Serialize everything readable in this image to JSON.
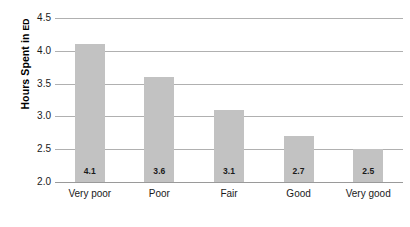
{
  "chart_data": {
    "type": "bar",
    "title": "",
    "subtitle": "",
    "xlabel": "",
    "ylabel": "Hours Spent in ED",
    "ylabel_main": "Hours Spent in",
    "ylabel_smallcaps": "ED",
    "categories": [
      "Very poor",
      "Poor",
      "Fair",
      "Good",
      "Very good"
    ],
    "values": [
      4.1,
      3.6,
      3.1,
      2.7,
      2.5
    ],
    "value_labels": [
      "4.1",
      "3.6",
      "3.1",
      "2.7",
      "2.5"
    ],
    "ylim": [
      2.0,
      4.5
    ],
    "ytick_labels": [
      "4.5",
      "4.0",
      "3.5",
      "3.0",
      "2.5",
      "2.0"
    ],
    "ytick_values": [
      4.5,
      4.0,
      3.5,
      3.0,
      2.5,
      2.0
    ],
    "ystep": 0.5,
    "grid": "horizontal",
    "legend": "none",
    "bar_color": "#c2c2c2",
    "gridline_color": "#b0b0b0",
    "axis_color": "#9a9a9a",
    "background_color": "#ffffff",
    "value_label_position": "inside-base"
  },
  "caption": {
    "clipped_text": ""
  }
}
